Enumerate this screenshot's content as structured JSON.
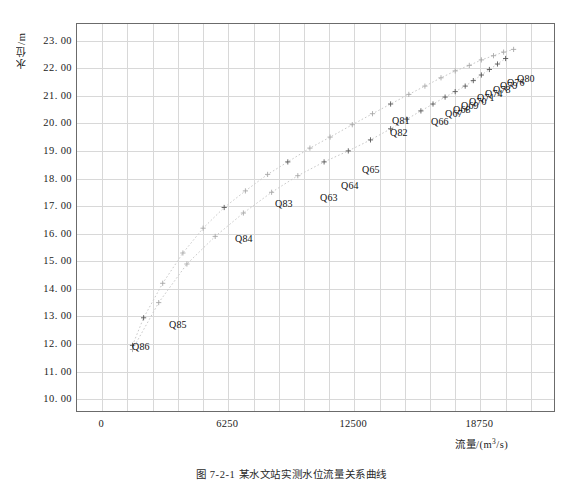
{
  "chart_data": {
    "type": "scatter",
    "title": "",
    "xlabel": "流量/(m³/s)",
    "ylabel": "水位/m",
    "xlim": [
      -1250,
      22500
    ],
    "ylim": [
      9.5,
      23.6
    ],
    "xticks": [
      0,
      6250,
      12500,
      18750
    ],
    "xtick_labels": [
      "0",
      "6250",
      "12500",
      "18750"
    ],
    "yticks": [
      10,
      11,
      12,
      13,
      14,
      15,
      16,
      17,
      18,
      19,
      20,
      21,
      22,
      23
    ],
    "ytick_labels": [
      "10. 00",
      "11. 00",
      "12. 00",
      "13. 00",
      "14. 00",
      "15. 00",
      "16. 00",
      "17. 00",
      "18. 00",
      "19. 00",
      "20. 00",
      "21. 00",
      "22. 00",
      "23. 00"
    ],
    "grid": true,
    "grid_x_step": 1250,
    "grid_y_step": 1,
    "marker": "+",
    "marker_color": "#7a7a7a",
    "line_color": "#c9c9c9",
    "series": [
      {
        "name": "curve-upper",
        "points": [
          {
            "x": 1500,
            "y": 11.95,
            "label": "Q86"
          },
          {
            "x": 2050,
            "y": 12.95,
            "label": "Q85"
          },
          {
            "x": 3000,
            "y": 14.2,
            "label": ""
          },
          {
            "x": 4000,
            "y": 15.3,
            "label": ""
          },
          {
            "x": 5000,
            "y": 16.2,
            "label": ""
          },
          {
            "x": 6050,
            "y": 16.95,
            "label": "Q84"
          },
          {
            "x": 7100,
            "y": 17.55,
            "label": ""
          },
          {
            "x": 8200,
            "y": 18.15,
            "label": ""
          },
          {
            "x": 9200,
            "y": 18.6,
            "label": "Q83"
          },
          {
            "x": 10300,
            "y": 19.1,
            "label": ""
          },
          {
            "x": 11300,
            "y": 19.5,
            "label": ""
          },
          {
            "x": 12400,
            "y": 19.95,
            "label": ""
          },
          {
            "x": 13400,
            "y": 20.35,
            "label": ""
          },
          {
            "x": 14300,
            "y": 20.7,
            "label": "Q81"
          },
          {
            "x": 15200,
            "y": 21.05,
            "label": ""
          },
          {
            "x": 16000,
            "y": 21.35,
            "label": ""
          },
          {
            "x": 16800,
            "y": 21.65,
            "label": ""
          },
          {
            "x": 17500,
            "y": 21.9,
            "label": ""
          },
          {
            "x": 18200,
            "y": 22.1,
            "label": ""
          },
          {
            "x": 18800,
            "y": 22.3,
            "label": ""
          },
          {
            "x": 19400,
            "y": 22.45,
            "label": ""
          },
          {
            "x": 19900,
            "y": 22.58,
            "label": ""
          },
          {
            "x": 20400,
            "y": 22.68,
            "label": ""
          }
        ]
      },
      {
        "name": "curve-lower",
        "points": [
          {
            "x": 1500,
            "y": 11.8,
            "label": ""
          },
          {
            "x": 2800,
            "y": 13.5,
            "label": ""
          },
          {
            "x": 4200,
            "y": 14.9,
            "label": ""
          },
          {
            "x": 5600,
            "y": 15.9,
            "label": ""
          },
          {
            "x": 7000,
            "y": 16.75,
            "label": ""
          },
          {
            "x": 8400,
            "y": 17.5,
            "label": ""
          },
          {
            "x": 9700,
            "y": 18.1,
            "label": ""
          },
          {
            "x": 11000,
            "y": 18.6,
            "label": "Q63"
          },
          {
            "x": 12200,
            "y": 19.0,
            "label": "Q64"
          },
          {
            "x": 13300,
            "y": 19.4,
            "label": "Q65"
          },
          {
            "x": 14300,
            "y": 19.8,
            "label": "Q82"
          },
          {
            "x": 15100,
            "y": 20.15,
            "label": "Q66"
          },
          {
            "x": 15800,
            "y": 20.45,
            "label": "Q67"
          },
          {
            "x": 16400,
            "y": 20.7,
            "label": "Q68"
          },
          {
            "x": 17000,
            "y": 20.95,
            "label": "Q69"
          },
          {
            "x": 17500,
            "y": 21.15,
            "label": "Q70"
          },
          {
            "x": 18000,
            "y": 21.35,
            "label": "Q71"
          },
          {
            "x": 18400,
            "y": 21.55,
            "label": "Q74"
          },
          {
            "x": 18800,
            "y": 21.75,
            "label": "Q78"
          },
          {
            "x": 19200,
            "y": 21.95,
            "label": "Q79"
          },
          {
            "x": 19600,
            "y": 22.15,
            "label": "Q76"
          },
          {
            "x": 20000,
            "y": 22.35,
            "label": "Q80"
          }
        ]
      }
    ],
    "point_labels": [
      {
        "text": "Q86",
        "x": 131,
        "y": 345
      },
      {
        "text": "Q85",
        "x": 168,
        "y": 323
      },
      {
        "text": "Q84",
        "x": 234,
        "y": 237
      },
      {
        "text": "Q83",
        "x": 274,
        "y": 202
      },
      {
        "text": "Q63",
        "x": 319,
        "y": 196
      },
      {
        "text": "Q64",
        "x": 340,
        "y": 184
      },
      {
        "text": "Q65",
        "x": 361,
        "y": 168
      },
      {
        "text": "Q81",
        "x": 391,
        "y": 119
      },
      {
        "text": "Q82",
        "x": 389,
        "y": 131
      },
      {
        "text": "Q66",
        "x": 430,
        "y": 120
      },
      {
        "text": "Q67",
        "x": 444,
        "y": 112
      },
      {
        "text": "Q68",
        "x": 452,
        "y": 108
      },
      {
        "text": "Q69",
        "x": 460,
        "y": 104
      },
      {
        "text": "Q70",
        "x": 468,
        "y": 100
      },
      {
        "text": "Q71",
        "x": 476,
        "y": 96
      },
      {
        "text": "Q74",
        "x": 484,
        "y": 92
      },
      {
        "text": "Q78",
        "x": 492,
        "y": 88
      },
      {
        "text": "Q79",
        "x": 499,
        "y": 84
      },
      {
        "text": "Q76",
        "x": 506,
        "y": 81
      },
      {
        "text": "Q80",
        "x": 516,
        "y": 77
      }
    ]
  },
  "caption": "图 7-2-1  某水文站实测水位流量关系曲线"
}
